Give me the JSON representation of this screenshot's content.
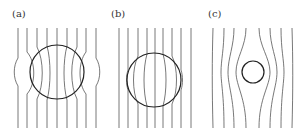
{
  "figure": {
    "panels": [
      {
        "id": "a",
        "label": "(a)",
        "description": "Field lines concentrated through a sphere (high permeability/paramagnetic-like)",
        "line_count": 9,
        "circle": {
          "cx": 57,
          "cy": 72,
          "r": 27
        }
      },
      {
        "id": "b",
        "label": "(b)",
        "description": "Field lines spread inside a sphere (diamagnetic-like)",
        "line_count": 9,
        "circle": {
          "cx": 154,
          "cy": 80,
          "r": 27
        }
      },
      {
        "id": "c",
        "label": "(c)",
        "description": "Field lines excluded from a small sphere (superconductor-like)",
        "line_count": 8,
        "circle": {
          "cx": 253,
          "cy": 72,
          "r": 11
        }
      }
    ],
    "colors": {
      "lines": "#555555",
      "circle": "#222222",
      "background": "#ffffff"
    }
  }
}
